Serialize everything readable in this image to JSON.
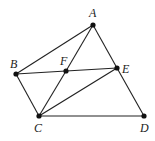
{
  "diagram": {
    "type": "geometry",
    "points": {
      "A": {
        "x": 93,
        "y": 25,
        "label": "A",
        "lx": 89,
        "ly": 17
      },
      "B": {
        "x": 16,
        "y": 74,
        "label": "B",
        "lx": 10,
        "ly": 68
      },
      "F": {
        "x": 66,
        "y": 71,
        "label": "F",
        "lx": 60,
        "ly": 65
      },
      "E": {
        "x": 117,
        "y": 68,
        "label": "E",
        "lx": 122,
        "ly": 73
      },
      "C": {
        "x": 39,
        "y": 116,
        "label": "C",
        "lx": 34,
        "ly": 132
      },
      "D": {
        "x": 144,
        "y": 116,
        "label": "D",
        "lx": 140,
        "ly": 132
      }
    },
    "segments": [
      [
        "A",
        "B"
      ],
      [
        "A",
        "F"
      ],
      [
        "F",
        "C"
      ],
      [
        "A",
        "E"
      ],
      [
        "E",
        "D"
      ],
      [
        "B",
        "F"
      ],
      [
        "F",
        "E"
      ],
      [
        "B",
        "C"
      ],
      [
        "C",
        "E"
      ],
      [
        "C",
        "D"
      ]
    ]
  }
}
